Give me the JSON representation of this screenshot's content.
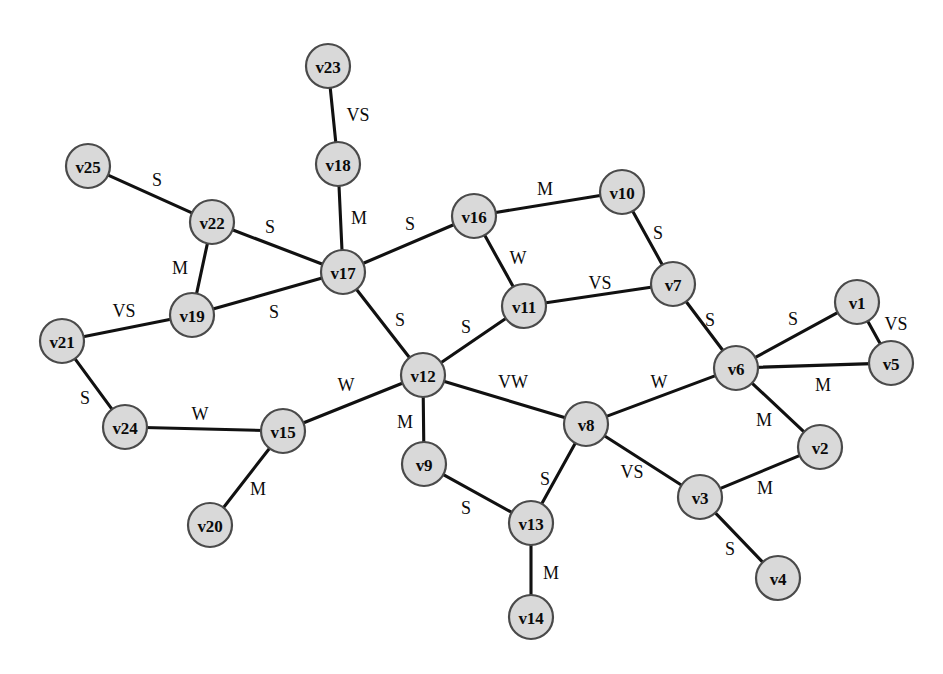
{
  "diagram": {
    "type": "undirected-weighted-graph",
    "title": "",
    "node_radius": 22,
    "node_fill": "#d9d9d9",
    "node_stroke": "#4a4a4a",
    "edge_color": "#111111",
    "background": "#ffffff",
    "weight_legend": [
      "VS",
      "S",
      "M",
      "W",
      "VW"
    ],
    "node_count": 25,
    "edge_count": 29
  },
  "nodes": [
    {
      "id": "v1",
      "label": "v1",
      "x": 857,
      "y": 302
    },
    {
      "id": "v2",
      "label": "v2",
      "x": 820,
      "y": 447
    },
    {
      "id": "v3",
      "label": "v3",
      "x": 700,
      "y": 497
    },
    {
      "id": "v4",
      "label": "v4",
      "x": 778,
      "y": 578
    },
    {
      "id": "v5",
      "label": "v5",
      "x": 891,
      "y": 363
    },
    {
      "id": "v6",
      "label": "v6",
      "x": 736,
      "y": 368
    },
    {
      "id": "v7",
      "label": "v7",
      "x": 673,
      "y": 284
    },
    {
      "id": "v8",
      "label": "v8",
      "x": 586,
      "y": 424
    },
    {
      "id": "v9",
      "label": "v9",
      "x": 424,
      "y": 464
    },
    {
      "id": "v10",
      "label": "v10",
      "x": 622,
      "y": 192
    },
    {
      "id": "v11",
      "label": "v11",
      "x": 524,
      "y": 306
    },
    {
      "id": "v12",
      "label": "v12",
      "x": 423,
      "y": 375
    },
    {
      "id": "v13",
      "label": "v13",
      "x": 531,
      "y": 523
    },
    {
      "id": "v14",
      "label": "v14",
      "x": 531,
      "y": 617
    },
    {
      "id": "v15",
      "label": "v15",
      "x": 283,
      "y": 431
    },
    {
      "id": "v16",
      "label": "v16",
      "x": 474,
      "y": 216
    },
    {
      "id": "v17",
      "label": "v17",
      "x": 343,
      "y": 272
    },
    {
      "id": "v18",
      "label": "v18",
      "x": 338,
      "y": 164
    },
    {
      "id": "v19",
      "label": "v19",
      "x": 192,
      "y": 315
    },
    {
      "id": "v20",
      "label": "v20",
      "x": 210,
      "y": 525
    },
    {
      "id": "v21",
      "label": "v21",
      "x": 62,
      "y": 341
    },
    {
      "id": "v22",
      "label": "v22",
      "x": 212,
      "y": 222
    },
    {
      "id": "v23",
      "label": "v23",
      "x": 328,
      "y": 66
    },
    {
      "id": "v24",
      "label": "v24",
      "x": 125,
      "y": 427
    },
    {
      "id": "v25",
      "label": "v25",
      "x": 88,
      "y": 166
    }
  ],
  "edges": [
    {
      "source": "v23",
      "target": "v18",
      "weight": "VS",
      "lx": 358,
      "ly": 115
    },
    {
      "source": "v18",
      "target": "v17",
      "weight": "M",
      "lx": 359,
      "ly": 218
    },
    {
      "source": "v25",
      "target": "v22",
      "weight": "S",
      "lx": 157,
      "ly": 180
    },
    {
      "source": "v22",
      "target": "v19",
      "weight": "M",
      "lx": 180,
      "ly": 268
    },
    {
      "source": "v22",
      "target": "v17",
      "weight": "S",
      "lx": 270,
      "ly": 227
    },
    {
      "source": "v19",
      "target": "v17",
      "weight": "S",
      "lx": 274,
      "ly": 312
    },
    {
      "source": "v21",
      "target": "v19",
      "weight": "VS",
      "lx": 124,
      "ly": 311
    },
    {
      "source": "v21",
      "target": "v24",
      "weight": "S",
      "lx": 85,
      "ly": 398
    },
    {
      "source": "v24",
      "target": "v15",
      "weight": "W",
      "lx": 200,
      "ly": 414
    },
    {
      "source": "v15",
      "target": "v20",
      "weight": "M",
      "lx": 258,
      "ly": 489
    },
    {
      "source": "v15",
      "target": "v12",
      "weight": "W",
      "lx": 346,
      "ly": 385
    },
    {
      "source": "v17",
      "target": "v16",
      "weight": "S",
      "lx": 410,
      "ly": 224
    },
    {
      "source": "v17",
      "target": "v12",
      "weight": "S",
      "lx": 400,
      "ly": 320
    },
    {
      "source": "v16",
      "target": "v10",
      "weight": "M",
      "lx": 545,
      "ly": 189
    },
    {
      "source": "v16",
      "target": "v11",
      "weight": "W",
      "lx": 518,
      "ly": 258
    },
    {
      "source": "v10",
      "target": "v7",
      "weight": "S",
      "lx": 658,
      "ly": 233
    },
    {
      "source": "v11",
      "target": "v7",
      "weight": "VS",
      "lx": 600,
      "ly": 283
    },
    {
      "source": "v11",
      "target": "v12",
      "weight": "S",
      "lx": 466,
      "ly": 327
    },
    {
      "source": "v7",
      "target": "v6",
      "weight": "S",
      "lx": 710,
      "ly": 320
    },
    {
      "source": "v6",
      "target": "v1",
      "weight": "S",
      "lx": 793,
      "ly": 319
    },
    {
      "source": "v1",
      "target": "v5",
      "weight": "VS",
      "lx": 896,
      "ly": 324
    },
    {
      "source": "v6",
      "target": "v5",
      "weight": "M",
      "lx": 823,
      "ly": 385
    },
    {
      "source": "v6",
      "target": "v2",
      "weight": "M",
      "lx": 764,
      "ly": 420
    },
    {
      "source": "v6",
      "target": "v8",
      "weight": "W",
      "lx": 659,
      "ly": 382
    },
    {
      "source": "v2",
      "target": "v3",
      "weight": "M",
      "lx": 765,
      "ly": 488
    },
    {
      "source": "v3",
      "target": "v4",
      "weight": "S",
      "lx": 730,
      "ly": 549
    },
    {
      "source": "v8",
      "target": "v3",
      "weight": "VS",
      "lx": 632,
      "ly": 472
    },
    {
      "source": "v8",
      "target": "v12",
      "weight": "VW",
      "lx": 513,
      "ly": 382
    },
    {
      "source": "v8",
      "target": "v13",
      "weight": "S",
      "lx": 545,
      "ly": 479
    },
    {
      "source": "v12",
      "target": "v9",
      "weight": "M",
      "lx": 405,
      "ly": 422
    },
    {
      "source": "v9",
      "target": "v13",
      "weight": "S",
      "lx": 466,
      "ly": 508
    },
    {
      "source": "v13",
      "target": "v14",
      "weight": "M",
      "lx": 551,
      "ly": 573
    }
  ]
}
